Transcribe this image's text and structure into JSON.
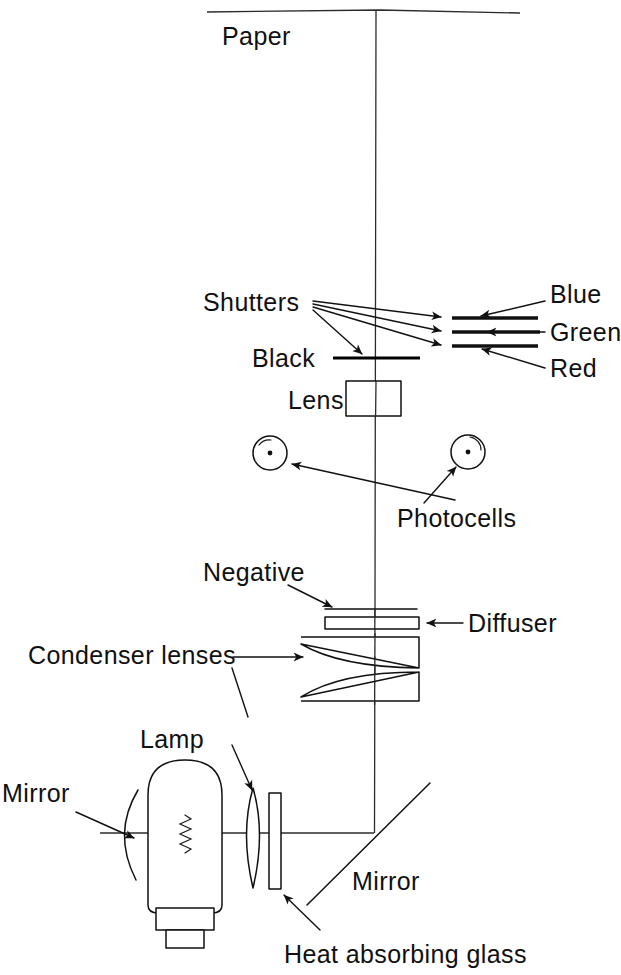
{
  "diagram": {
    "style": "hand-drawn line diagram",
    "ink_color": "#111111",
    "background_color": "#ffffff",
    "labels": {
      "paper": "Paper",
      "shutters": "Shutters",
      "blue": "Blue",
      "green": "Green",
      "red": "Red",
      "black": "Black",
      "lens": "Lens",
      "photocells": "Photocells",
      "negative": "Negative",
      "diffuser": "Diffuser",
      "condenser_lenses": "Condenser lenses",
      "lamp": "Lamp",
      "mirror_left": "Mirror",
      "mirror_bottom": "Mirror",
      "heat_absorbing_glass": "Heat absorbing glass"
    },
    "components": [
      {
        "name": "paper",
        "label": "Paper",
        "type": "horizontal-plane",
        "y": 11
      },
      {
        "name": "shutters",
        "label": "Shutters",
        "type": "fan-leader",
        "origin_x": 313,
        "origin_y": 302
      },
      {
        "name": "blue-filter",
        "label": "Blue",
        "type": "filter-bar",
        "y": 318
      },
      {
        "name": "green-filter",
        "label": "Green",
        "type": "filter-bar",
        "y": 332
      },
      {
        "name": "red-filter",
        "label": "Red",
        "type": "filter-bar",
        "y": 346
      },
      {
        "name": "black-shutter",
        "label": "Black",
        "type": "bar",
        "y": 358
      },
      {
        "name": "lens",
        "label": "Lens",
        "type": "rectangle",
        "y": 380
      },
      {
        "name": "photocell-left",
        "label": "Photocells",
        "type": "circle",
        "cx": 270,
        "cy": 453
      },
      {
        "name": "photocell-right",
        "label": "Photocells",
        "type": "circle",
        "cx": 468,
        "cy": 452
      },
      {
        "name": "negative",
        "label": "Negative",
        "type": "thin-plane",
        "y": 609
      },
      {
        "name": "diffuser",
        "label": "Diffuser",
        "type": "thin-rectangle",
        "y": 617
      },
      {
        "name": "condenser-lens-upper",
        "label": "Condenser lenses",
        "type": "plano-convex",
        "y": 633
      },
      {
        "name": "condenser-lens-lower",
        "label": "Condenser lenses",
        "type": "plano-convex",
        "y": 676
      },
      {
        "name": "lamp",
        "label": "Lamp",
        "type": "bulb",
        "cx": 185,
        "cy": 833
      },
      {
        "name": "mirror-left",
        "label": "Mirror",
        "type": "concave-arc",
        "x": 128
      },
      {
        "name": "condenser-lamp-lens",
        "label": "",
        "type": "biconvex",
        "x": 253
      },
      {
        "name": "heat-absorbing-glass",
        "label": "Heat absorbing glass",
        "type": "plate",
        "x": 274
      },
      {
        "name": "mirror-bottom",
        "label": "Mirror",
        "type": "45-degree-flat",
        "x": 375,
        "y": 833
      }
    ]
  }
}
